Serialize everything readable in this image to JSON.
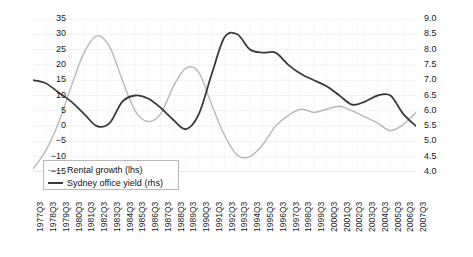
{
  "chart_data": {
    "type": "line",
    "title": "",
    "xlabel": "",
    "ylabel_left": "",
    "ylabel_right": "",
    "grid": true,
    "legend_position": "lower-left",
    "ylim_left": [
      -15,
      35
    ],
    "ylim_right": [
      4.0,
      9.0
    ],
    "yticks_left": [
      "35",
      "30",
      "25",
      "20",
      "15",
      "10",
      "5",
      "0",
      "−5",
      "−10",
      "−15"
    ],
    "yticks_right": [
      "9.0",
      "8.5",
      "8.0",
      "7.5",
      "7.0",
      "6.5",
      "6.0",
      "5.5",
      "5.0",
      "4.5",
      "4.0"
    ],
    "categories": [
      "1977Q3",
      "1978Q3",
      "1979Q3",
      "1980Q3",
      "1981Q3",
      "1982Q3",
      "1983Q3",
      "1984Q3",
      "1985Q3",
      "1986Q3",
      "1987Q3",
      "1988Q3",
      "1989Q3",
      "1990Q3",
      "1991Q3",
      "1992Q3",
      "1993Q3",
      "1994Q3",
      "1995Q3",
      "1996Q3",
      "1997Q3",
      "1998Q3",
      "1999Q3",
      "2000Q3",
      "2001Q3",
      "2002Q3",
      "2003Q3",
      "2004Q3",
      "2005Q3",
      "2006Q3",
      "2007Q3"
    ],
    "series": [
      {
        "name": "Rental growth (lhs)",
        "axis": "left",
        "color": "#b8b8b8",
        "values": [
          -14.0,
          -8.0,
          1.0,
          13.0,
          24.0,
          29.5,
          26.0,
          15.0,
          5.0,
          1.5,
          4.0,
          13.0,
          19.0,
          17.5,
          7.0,
          -3.0,
          -9.5,
          -10.0,
          -6.0,
          0.0,
          3.5,
          5.5,
          4.5,
          5.5,
          6.5,
          5.0,
          3.0,
          1.0,
          -1.5,
          0.5,
          4.5
        ]
      },
      {
        "name": "Sydney office yield (rhs)",
        "axis": "right",
        "color": "#3a3a3a",
        "values": [
          7.0,
          6.9,
          6.6,
          6.3,
          5.9,
          5.5,
          5.6,
          6.3,
          6.5,
          6.4,
          6.1,
          5.7,
          5.4,
          5.9,
          7.2,
          8.4,
          8.5,
          8.0,
          7.9,
          7.9,
          7.5,
          7.2,
          7.0,
          6.8,
          6.5,
          6.2,
          6.3,
          6.5,
          6.5,
          5.9,
          5.5
        ]
      }
    ]
  },
  "legend": {
    "items": [
      {
        "label": "Rental growth (lhs)"
      },
      {
        "label": "Sydney office yield (rhs)"
      }
    ]
  },
  "caption": ""
}
